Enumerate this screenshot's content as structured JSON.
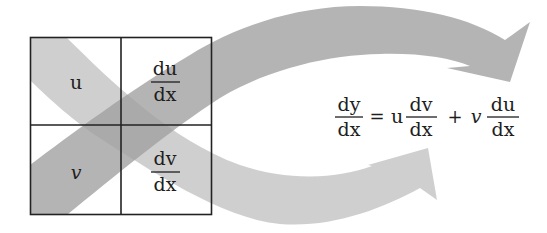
{
  "diagram": {
    "colors": {
      "upper_arrow": "#9f9f9f",
      "lower_arrow": "#bdbdbd",
      "grid": "#222222",
      "text": "#1e1e1e",
      "background": "#ffffff"
    },
    "grid": {
      "cells": [
        {
          "position": "top-left",
          "label": "u"
        },
        {
          "position": "top-right",
          "numerator": "du",
          "denominator": "dx"
        },
        {
          "position": "bottom-left",
          "label": "v"
        },
        {
          "position": "bottom-right",
          "numerator": "dv",
          "denominator": "dx"
        }
      ]
    },
    "arrows": [
      {
        "id": "upper",
        "from": "v (bottom-left)",
        "through": "du/dx (top-right)",
        "to": "v du/dx term"
      },
      {
        "id": "lower",
        "from": "u (top-left)",
        "through": "dv/dx (bottom-right)",
        "to": "u dv/dx term"
      }
    ],
    "equation": {
      "lhs_num": "dy",
      "lhs_den": "dx",
      "equals": "=",
      "term1_coef": "u",
      "term1_num": "dv",
      "term1_den": "dx",
      "plus": "+",
      "term2_coef": "v",
      "term2_num": "du",
      "term2_den": "dx"
    }
  }
}
